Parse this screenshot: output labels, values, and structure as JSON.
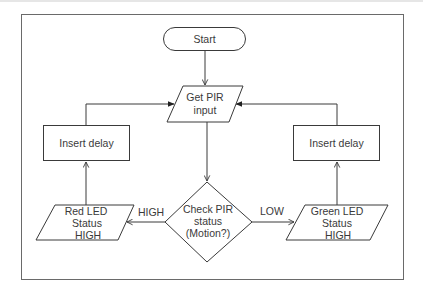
{
  "diagram": {
    "type": "flowchart",
    "nodes": {
      "start": {
        "label": "Start",
        "shape": "terminator"
      },
      "get_pir": {
        "line1": "Get PIR",
        "line2": "input",
        "shape": "parallelogram"
      },
      "check_pir": {
        "line1": "Check PIR",
        "line2": "status",
        "line3": "(Motion?)",
        "shape": "diamond"
      },
      "red_led": {
        "line1": "Red LED",
        "line2": "Status",
        "line3": "HIGH",
        "shape": "parallelogram"
      },
      "green_led": {
        "line1": "Green LED",
        "line2": "Status",
        "line3": "HIGH",
        "shape": "parallelogram"
      },
      "delay_left": {
        "label": "Insert delay",
        "shape": "rectangle"
      },
      "delay_right": {
        "label": "Insert delay",
        "shape": "rectangle"
      }
    },
    "edges": {
      "high_label": "HIGH",
      "low_label": "LOW"
    },
    "colors": {
      "stroke": "#3a3a3a",
      "fill": "#ffffff",
      "frame": "#6a6a6a"
    }
  }
}
